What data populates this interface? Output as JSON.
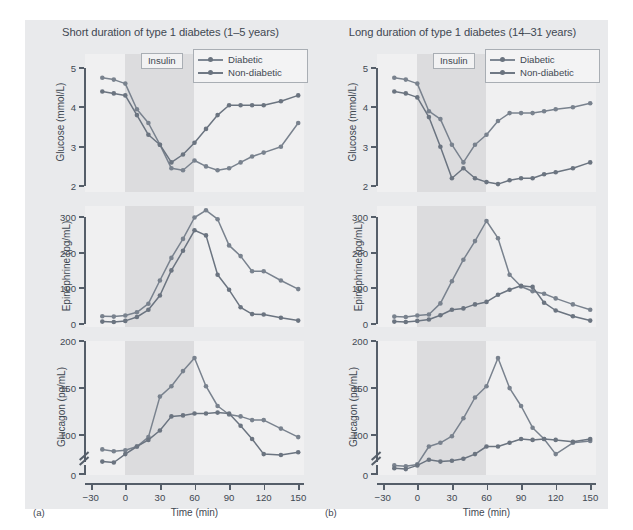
{
  "figure": {
    "xlabel": "Time (min)",
    "xticks": [
      -30,
      0,
      30,
      60,
      90,
      120,
      150
    ],
    "xlim": [
      -35,
      155
    ],
    "insulin_band": {
      "label": "Insulin",
      "start": 0,
      "end": 60
    },
    "legend": {
      "position": "top-right",
      "entries": [
        {
          "key": "diabetic",
          "label": "Diabetic",
          "color": "#7e8793"
        },
        {
          "key": "non_diabetic",
          "label": "Non-diabetic",
          "color": "#6f7884"
        }
      ]
    },
    "series_colors": {
      "diabetic": "#79828e",
      "non_diabetic": "#6b7480"
    }
  },
  "panels": [
    {
      "letter": "(a)",
      "title": "Short duration of type 1 diabetes (1–5 years)",
      "charts": [
        {
          "type": "line",
          "ylabel": "Glucose (mmol/L)",
          "yticks": [
            2,
            3,
            4,
            5
          ],
          "ylim": [
            1.85,
            5.35
          ],
          "axis_break": false,
          "x": [
            -20,
            -10,
            0,
            10,
            20,
            30,
            40,
            50,
            60,
            70,
            80,
            90,
            100,
            110,
            120,
            135,
            150
          ],
          "series": [
            {
              "name": "Diabetic",
              "values": [
                4.75,
                4.7,
                4.6,
                3.95,
                3.6,
                3.05,
                2.45,
                2.4,
                2.65,
                2.5,
                2.4,
                2.45,
                2.6,
                2.75,
                2.85,
                3.0,
                3.6
              ]
            },
            {
              "name": "Non-diabetic",
              "values": [
                4.4,
                4.35,
                4.3,
                3.8,
                3.3,
                3.05,
                2.6,
                2.8,
                3.1,
                3.45,
                3.8,
                4.05,
                4.05,
                4.05,
                4.05,
                4.15,
                4.3
              ]
            }
          ]
        },
        {
          "type": "line",
          "ylabel": "Epinephrine (pg/mL)",
          "yticks": [
            0,
            100,
            200,
            300
          ],
          "ylim": [
            -8,
            330
          ],
          "axis_break": false,
          "x": [
            -20,
            -10,
            0,
            10,
            20,
            30,
            40,
            50,
            60,
            70,
            80,
            90,
            100,
            110,
            120,
            135,
            150
          ],
          "series": [
            {
              "name": "Diabetic",
              "values": [
                22,
                21,
                24,
                33,
                57,
                122,
                185,
                238,
                298,
                318,
                293,
                220,
                190,
                148,
                148,
                122,
                98
              ]
            },
            {
              "name": "Non-diabetic",
              "values": [
                7,
                6,
                9,
                20,
                40,
                80,
                150,
                205,
                262,
                248,
                138,
                96,
                47,
                28,
                27,
                18,
                10
              ]
            }
          ]
        },
        {
          "type": "line",
          "ylabel": "Glucagon (pg/mL)",
          "yticks": [
            0,
            100,
            150,
            200
          ],
          "ylim": [
            0,
            200
          ],
          "axis_break": true,
          "break_between": [
            0,
            72
          ],
          "x": [
            -20,
            -10,
            0,
            10,
            20,
            30,
            40,
            50,
            60,
            70,
            80,
            90,
            100,
            110,
            120,
            135,
            150
          ],
          "series": [
            {
              "name": "Diabetic",
              "values": [
                85,
                83,
                84,
                88,
                98,
                141,
                152,
                168,
                182,
                152,
                131,
                122,
                120,
                116,
                116,
                107,
                98
              ]
            },
            {
              "name": "Non-diabetic",
              "values": [
                72,
                71,
                80,
                88,
                95,
                105,
                120,
                121,
                123,
                123,
                124,
                123,
                110,
                96,
                80,
                79,
                82
              ]
            }
          ]
        }
      ]
    },
    {
      "letter": "(b)",
      "title": "Long duration of type 1 diabetes (14–31 years)",
      "charts": [
        {
          "type": "line",
          "ylabel": "Glucose (mmol/L)",
          "yticks": [
            2,
            3,
            4,
            5
          ],
          "ylim": [
            1.85,
            5.35
          ],
          "axis_break": false,
          "x": [
            -20,
            -10,
            0,
            10,
            20,
            30,
            40,
            50,
            60,
            70,
            80,
            90,
            100,
            110,
            120,
            135,
            150
          ],
          "series": [
            {
              "name": "Diabetic",
              "values": [
                4.75,
                4.7,
                4.6,
                3.9,
                3.7,
                3.05,
                2.6,
                3.05,
                3.3,
                3.65,
                3.85,
                3.85,
                3.85,
                3.9,
                3.95,
                4.0,
                4.1
              ]
            },
            {
              "name": "Non-diabetic",
              "values": [
                4.4,
                4.35,
                4.25,
                3.75,
                3.0,
                2.2,
                2.45,
                2.2,
                2.1,
                2.05,
                2.15,
                2.2,
                2.2,
                2.3,
                2.35,
                2.45,
                2.6
              ]
            }
          ]
        },
        {
          "type": "line",
          "ylabel": "Epinephrine (pg/mL)",
          "yticks": [
            0,
            100,
            200,
            300
          ],
          "ylim": [
            -8,
            330
          ],
          "axis_break": false,
          "x": [
            -20,
            -10,
            0,
            10,
            20,
            30,
            40,
            50,
            60,
            70,
            80,
            90,
            100,
            110,
            120,
            135,
            150
          ],
          "series": [
            {
              "name": "Diabetic",
              "values": [
                21,
                20,
                24,
                27,
                58,
                120,
                180,
                232,
                288,
                240,
                138,
                105,
                92,
                85,
                72,
                55,
                40
              ]
            },
            {
              "name": "Non-diabetic",
              "values": [
                7,
                6,
                9,
                13,
                25,
                40,
                44,
                55,
                62,
                82,
                96,
                107,
                104,
                60,
                38,
                22,
                10
              ]
            }
          ]
        },
        {
          "type": "line",
          "ylabel": "Glucagon (pg/mL)",
          "yticks": [
            0,
            100,
            150,
            200
          ],
          "ylim": [
            0,
            200
          ],
          "axis_break": true,
          "break_between": [
            0,
            72
          ],
          "x": [
            -20,
            -10,
            0,
            10,
            20,
            30,
            40,
            50,
            60,
            70,
            80,
            90,
            100,
            110,
            120,
            135,
            150
          ],
          "series": [
            {
              "name": "Diabetic",
              "values": [
                68,
                67,
                69,
                88,
                92,
                99,
                118,
                140,
                152,
                182,
                150,
                131,
                108,
                96,
                80,
                92,
                94
              ]
            },
            {
              "name": "Non-diabetic",
              "values": [
                65,
                64,
                68,
                74,
                72,
                73,
                75,
                80,
                88,
                88,
                92,
                96,
                95,
                96,
                95,
                93,
                96
              ]
            }
          ]
        }
      ]
    }
  ]
}
